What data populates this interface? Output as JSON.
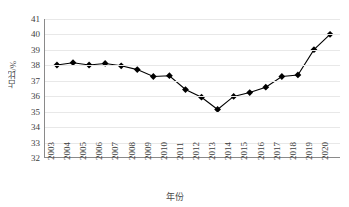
{
  "chart_data": {
    "type": "line",
    "title": "",
    "xlabel": "年份",
    "ylabel": "占比/%",
    "categories": [
      "2003",
      "2004",
      "2005",
      "2006",
      "2007",
      "2008",
      "2009",
      "2010",
      "2011",
      "2012",
      "2013",
      "2014",
      "2015",
      "2016",
      "2017",
      "2018",
      "2019",
      "2020"
    ],
    "values": [
      38.0,
      38.15,
      38.0,
      38.1,
      37.95,
      37.7,
      37.25,
      37.3,
      36.4,
      35.9,
      35.1,
      35.95,
      36.2,
      36.55,
      37.25,
      37.35,
      39.0,
      40.0
    ],
    "ylim": [
      32,
      41
    ],
    "ytick_labels": [
      "41",
      "40",
      "39",
      "38",
      "37",
      "36",
      "35",
      "34",
      "33",
      "32"
    ],
    "ytick_values": [
      41,
      40,
      39,
      38,
      37,
      36,
      35,
      34,
      33,
      32
    ],
    "grid": true,
    "grid_axis": "y",
    "legend": null,
    "marker": "diamond",
    "series_color": "#000000",
    "grid_color": "#e8e8e8",
    "axis_color": "#8a8a8a",
    "text_color": "#3d3d3d"
  }
}
